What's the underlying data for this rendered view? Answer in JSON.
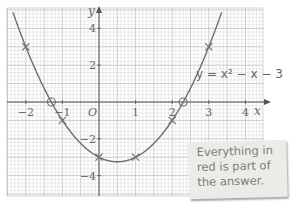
{
  "chart_data": {
    "type": "line",
    "title": "",
    "equation_label": "y = x² − x − 3",
    "xlabel": "x",
    "ylabel": "y",
    "origin_label": "O",
    "xlim": [
      -2.5,
      4.4
    ],
    "ylim": [
      -5.0,
      5.1
    ],
    "x_ticks": [
      -2,
      -1,
      1,
      2,
      3,
      4
    ],
    "x_tick_labels": [
      "−2",
      "−1",
      "1",
      "2",
      "3",
      "4"
    ],
    "y_ticks": [
      -4,
      -2,
      2,
      4
    ],
    "y_tick_labels": [
      "−4",
      "−2",
      "2",
      "4"
    ],
    "grid": true,
    "series": [
      {
        "name": "y = x² − x − 3",
        "function": "x^2 - x - 3",
        "x_range": [
          -2.35,
          3.35
        ],
        "plotted_points": [
          {
            "x": -2,
            "y": 3
          },
          {
            "x": -1,
            "y": -1
          },
          {
            "x": 0,
            "y": -3
          },
          {
            "x": 1,
            "y": -3
          },
          {
            "x": 2,
            "y": -1
          },
          {
            "x": 3,
            "y": 3
          }
        ],
        "roots_circled": [
          {
            "x": -1.3,
            "y": 0
          },
          {
            "x": 2.3,
            "y": 0
          }
        ]
      }
    ]
  },
  "note": {
    "lines": [
      "Everything in",
      "red is part of",
      "the answer."
    ]
  },
  "colors": {
    "grid_minor": "#d9d9d9",
    "grid_major": "#b8b8b8",
    "axis": "#555555",
    "curve": "#6e6e6e",
    "text": "#666666",
    "note_bg": "#ecebe8"
  }
}
